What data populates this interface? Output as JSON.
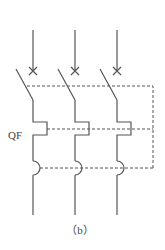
{
  "diagram": {
    "type": "three-pole circuit breaker symbol",
    "device_label": "QF",
    "caption": "（b）",
    "poles": [
      {
        "name": "pole-1"
      },
      {
        "name": "pole-2"
      },
      {
        "name": "pole-3"
      }
    ],
    "colors": {
      "line": "#555555",
      "background": "#ffffff"
    }
  }
}
